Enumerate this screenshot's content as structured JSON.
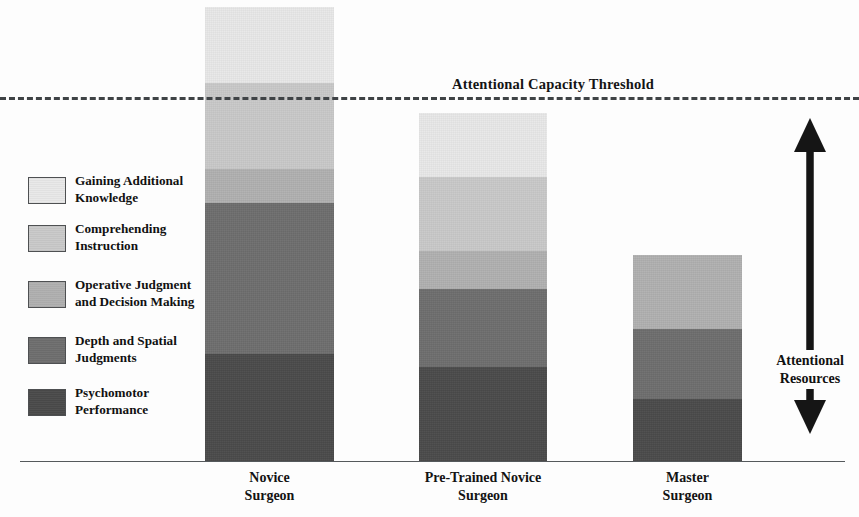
{
  "chart_data": {
    "type": "bar",
    "title": "",
    "subtype": "stacked",
    "orientation": "vertical",
    "xlabel": "",
    "ylabel": "Attentional Resources",
    "grid": false,
    "legend_position": "left",
    "categories": [
      "Novice\nSurgeon",
      "Pre-Trained Novice\nSurgeon",
      "Master\nSurgeon"
    ],
    "series": [
      {
        "name": "Psychomotor Performance",
        "color": "#4a4a4a",
        "values": [
          107,
          94,
          62
        ]
      },
      {
        "name": "Depth and Spatial Judgments",
        "color": "#6e6e6e",
        "values": [
          151,
          78,
          70
        ]
      },
      {
        "name": "Operative Judgment and Decision Making",
        "color": "#b0b0b0",
        "values": [
          34,
          38,
          74
        ]
      },
      {
        "name": "Comprehending Instruction",
        "color": "#c9c9c9",
        "values": [
          86,
          74,
          0
        ]
      },
      {
        "name": "Gaining Additional Knowledge",
        "color": "#e8e8e8",
        "values": [
          76,
          64,
          0
        ]
      }
    ],
    "totals": [
      454,
      348,
      206
    ],
    "threshold": {
      "label": "Attentional Capacity Threshold",
      "value": 363,
      "style": "dashed"
    },
    "annotation": {
      "label": "Attentional Resources",
      "arrow": "double-headed-vertical"
    },
    "units": "pixels of bar height (unlabeled qualitative axis)"
  },
  "threshold": {
    "label": "Attentional Capacity Threshold"
  },
  "annotation": {
    "label_line1": "Attentional",
    "label_line2": "Resources"
  },
  "legend": {
    "items": [
      {
        "label_line1": "Gaining Additional",
        "label_line2": "Knowledge",
        "color": "#e8e8e8"
      },
      {
        "label_line1": "Comprehending",
        "label_line2": "Instruction",
        "color": "#c9c9c9"
      },
      {
        "label_line1": "Operative Judgment",
        "label_line2": "and Decision Making",
        "color": "#b0b0b0"
      },
      {
        "label_line1": "Depth and Spatial",
        "label_line2": "Judgments",
        "color": "#6e6e6e"
      },
      {
        "label_line1": "Psychomotor",
        "label_line2": "Performance",
        "color": "#4a4a4a"
      }
    ]
  },
  "bars": [
    {
      "name": "novice-surgeon",
      "label_line1": "Novice",
      "label_line2": "Surgeon",
      "segments": [
        {
          "series": "Gaining Additional Knowledge",
          "color": "#e8e8e8",
          "height": 76
        },
        {
          "series": "Comprehending Instruction",
          "color": "#c9c9c9",
          "height": 86
        },
        {
          "series": "Operative Judgment and Decision Making",
          "color": "#b0b0b0",
          "height": 34
        },
        {
          "series": "Depth and Spatial Judgments",
          "color": "#6e6e6e",
          "height": 151
        },
        {
          "series": "Psychomotor Performance",
          "color": "#4a4a4a",
          "height": 107
        }
      ]
    },
    {
      "name": "pre-trained-novice-surgeon",
      "label_line1": "Pre-Trained Novice",
      "label_line2": "Surgeon",
      "segments": [
        {
          "series": "Gaining Additional Knowledge",
          "color": "#e8e8e8",
          "height": 64
        },
        {
          "series": "Comprehending Instruction",
          "color": "#c9c9c9",
          "height": 74
        },
        {
          "series": "Operative Judgment and Decision Making",
          "color": "#b0b0b0",
          "height": 38
        },
        {
          "series": "Depth and Spatial Judgments",
          "color": "#6e6e6e",
          "height": 78
        },
        {
          "series": "Psychomotor Performance",
          "color": "#4a4a4a",
          "height": 94
        }
      ]
    },
    {
      "name": "master-surgeon",
      "label_line1": "Master",
      "label_line2": "Surgeon",
      "segments": [
        {
          "series": "Operative Judgment and Decision Making",
          "color": "#b0b0b0",
          "height": 74
        },
        {
          "series": "Depth and Spatial Judgments",
          "color": "#6e6e6e",
          "height": 70
        },
        {
          "series": "Psychomotor Performance",
          "color": "#4a4a4a",
          "height": 62
        }
      ]
    }
  ],
  "bleed_text": "illegible reverse-page bleed-through"
}
